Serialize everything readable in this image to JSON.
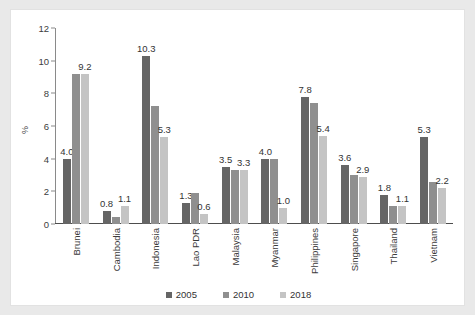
{
  "page": {
    "cropped_title_fragment": "",
    "background_color": "#e9e9e9",
    "card_color": "#ffffff"
  },
  "chart_data": {
    "type": "bar",
    "title": "",
    "xlabel": "",
    "ylabel": "%",
    "ylim": [
      0,
      12
    ],
    "yticks": [
      0,
      2,
      4,
      6,
      8,
      10,
      12
    ],
    "grid": false,
    "legend_position": "bottom",
    "categories": [
      "Brunei",
      "Cambodia",
      "Indonesia",
      "Lao PDR",
      "Malaysia",
      "Myanmar",
      "Philippines",
      "Singapore",
      "Thailand",
      "Vietnam"
    ],
    "series": [
      {
        "name": "2005",
        "color": "#656565",
        "values": [
          4.0,
          0.8,
          10.3,
          1.3,
          3.5,
          4.0,
          7.8,
          3.6,
          1.8,
          5.3
        ]
      },
      {
        "name": "2010",
        "color": "#8f8f8f",
        "values": [
          9.2,
          0.4,
          7.2,
          1.9,
          3.3,
          4.0,
          7.4,
          3.0,
          1.1,
          2.6
        ]
      },
      {
        "name": "2018",
        "color": "#c4c4c4",
        "values": [
          9.2,
          1.1,
          5.3,
          0.6,
          3.3,
          1.0,
          5.4,
          2.9,
          1.1,
          2.2
        ]
      }
    ],
    "data_labels": [
      {
        "category": "Brunei",
        "labels": [
          {
            "series": "2005",
            "text": "4.0"
          },
          {
            "series": "2018",
            "text": "9.2"
          }
        ]
      },
      {
        "category": "Cambodia",
        "labels": [
          {
            "series": "2005",
            "text": "0.8"
          },
          {
            "series": "2018",
            "text": "1.1"
          }
        ]
      },
      {
        "category": "Indonesia",
        "labels": [
          {
            "series": "2005",
            "text": "10.3"
          },
          {
            "series": "2018",
            "text": "5.3"
          }
        ]
      },
      {
        "category": "Lao PDR",
        "labels": [
          {
            "series": "2005",
            "text": "1.3"
          },
          {
            "series": "2018",
            "text": "0.6"
          }
        ]
      },
      {
        "category": "Malaysia",
        "labels": [
          {
            "series": "2005",
            "text": "3.5"
          },
          {
            "series": "2018",
            "text": "3.3"
          }
        ]
      },
      {
        "category": "Myanmar",
        "labels": [
          {
            "series": "2005",
            "text": "4.0"
          },
          {
            "series": "2018",
            "text": "1.0"
          }
        ]
      },
      {
        "category": "Philippines",
        "labels": [
          {
            "series": "2005",
            "text": "7.8"
          },
          {
            "series": "2018",
            "text": "5.4"
          }
        ]
      },
      {
        "category": "Singapore",
        "labels": [
          {
            "series": "2005",
            "text": "3.6"
          },
          {
            "series": "2018",
            "text": "2.9"
          }
        ]
      },
      {
        "category": "Thailand",
        "labels": [
          {
            "series": "2005",
            "text": "1.8"
          },
          {
            "series": "2018",
            "text": "1.1"
          }
        ]
      },
      {
        "category": "Vietnam",
        "labels": [
          {
            "series": "2005",
            "text": "5.3"
          },
          {
            "series": "2018",
            "text": "2.2"
          }
        ]
      }
    ],
    "legend": [
      {
        "label": "2005",
        "color": "#656565"
      },
      {
        "label": "2010",
        "color": "#8f8f8f"
      },
      {
        "label": "2018",
        "color": "#c4c4c4"
      }
    ]
  }
}
